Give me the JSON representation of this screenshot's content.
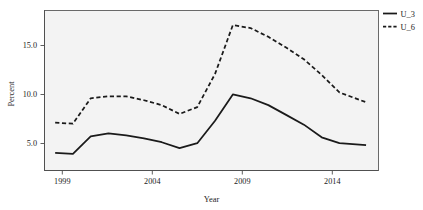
{
  "chart_data": {
    "type": "line",
    "title": "",
    "xlabel": "Year",
    "ylabel": "Percent",
    "xlim": [
      1998.4,
      2017.2
    ],
    "ylim": [
      2.2,
      18.6
    ],
    "xticks": [
      1999,
      2004,
      2009,
      2014
    ],
    "xtick_labels": [
      "1999",
      "2004",
      "2009",
      "2014"
    ],
    "yticks": [
      5.0,
      10.0,
      15.0
    ],
    "ytick_labels": [
      "5.0",
      "10.0",
      "15.0"
    ],
    "grid": false,
    "legend_position": "right-top",
    "x": [
      1999,
      2000,
      2001,
      2002,
      2003,
      2004,
      2005,
      2006,
      2007,
      2008,
      2009,
      2010,
      2011,
      2012,
      2013,
      2014,
      2015,
      2016.5
    ],
    "series": [
      {
        "name": "U_3",
        "style": "solid",
        "color": "#1a1a1a",
        "values": [
          4.0,
          3.9,
          5.7,
          6.0,
          5.8,
          5.5,
          5.1,
          4.5,
          5.0,
          7.3,
          10.0,
          9.6,
          8.9,
          7.9,
          6.9,
          5.6,
          5.0,
          4.8
        ]
      },
      {
        "name": "U_6",
        "style": "dashed",
        "color": "#1a1a1a",
        "values": [
          7.1,
          7.0,
          9.6,
          9.8,
          9.8,
          9.4,
          8.9,
          8.0,
          8.7,
          12.1,
          17.1,
          16.8,
          15.9,
          14.8,
          13.6,
          12.0,
          10.2,
          9.2
        ]
      }
    ]
  },
  "legend": {
    "entries": [
      {
        "label": "U_3",
        "style": "solid"
      },
      {
        "label": "U_6",
        "style": "dashed"
      }
    ]
  },
  "axes": {
    "x_title": "Year",
    "y_title": "Percent"
  },
  "colors": {
    "panel_background": "#f3f3f3",
    "line": "#1a1a1a",
    "axis": "#4d4d4d",
    "text": "#1c1c1c"
  }
}
